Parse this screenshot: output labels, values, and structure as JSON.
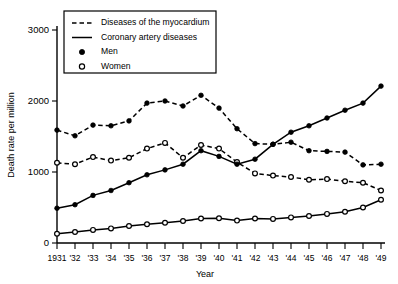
{
  "chart_data": {
    "type": "line",
    "title": "",
    "xlabel": "Year",
    "ylabel": "Death rate per million",
    "ylim": [
      0,
      3000
    ],
    "yticks": [
      0,
      1000,
      2000,
      3000
    ],
    "ytick_labels": [
      "0",
      "1000",
      "2000",
      "3000"
    ],
    "grid": false,
    "legend_position": "top-left-inset",
    "x": [
      1931,
      1932,
      1933,
      1934,
      1935,
      1936,
      1937,
      1938,
      1939,
      1940,
      1941,
      1942,
      1943,
      1944,
      1945,
      1946,
      1947,
      1948,
      1949
    ],
    "xtick_labels": [
      "1931",
      "'32",
      "'33",
      "'34",
      "'35",
      "'36",
      "'37",
      "'38",
      "'39",
      "'40",
      "'41",
      "'42",
      "'43",
      "'44",
      "'45",
      "'46",
      "'47",
      "'48",
      "'49"
    ],
    "series": [
      {
        "name": "Diseases of the myocardium — Men",
        "disease": "Diseases of the myocardium",
        "sex": "Men",
        "line_style": "dashed",
        "marker": "filled-circle",
        "color": "#000000",
        "values": [
          1590,
          1510,
          1660,
          1650,
          1720,
          1970,
          2000,
          1930,
          2080,
          1900,
          1610,
          1400,
          1390,
          1420,
          1300,
          1290,
          1280,
          1100,
          1110
        ]
      },
      {
        "name": "Diseases of the myocardium — Women",
        "disease": "Diseases of the myocardium",
        "sex": "Women",
        "line_style": "dashed",
        "marker": "open-circle",
        "color": "#000000",
        "values": [
          1130,
          1110,
          1210,
          1160,
          1200,
          1330,
          1410,
          1200,
          1380,
          1330,
          1140,
          980,
          950,
          930,
          890,
          900,
          870,
          850,
          740
        ]
      },
      {
        "name": "Coronary artery diseases — Men",
        "disease": "Coronary artery diseases",
        "sex": "Men",
        "line_style": "solid",
        "marker": "filled-circle",
        "color": "#000000",
        "values": [
          490,
          540,
          670,
          740,
          850,
          960,
          1030,
          1110,
          1300,
          1220,
          1110,
          1180,
          1390,
          1560,
          1650,
          1760,
          1870,
          1970,
          2210
        ]
      },
      {
        "name": "Coronary artery diseases — Women",
        "disease": "Coronary artery diseases",
        "sex": "Women",
        "line_style": "solid",
        "marker": "open-circle",
        "color": "#000000",
        "values": [
          130,
          155,
          185,
          205,
          240,
          265,
          285,
          310,
          345,
          350,
          315,
          345,
          340,
          360,
          380,
          410,
          440,
          500,
          610
        ]
      }
    ]
  },
  "legend": {
    "entries": [
      {
        "label": "Diseases of the myocardium",
        "sample": "dashed-line"
      },
      {
        "label": "Coronary artery diseases",
        "sample": "solid-line"
      },
      {
        "label": "Men",
        "sample": "filled-circle"
      },
      {
        "label": "Women",
        "sample": "open-circle"
      }
    ]
  }
}
